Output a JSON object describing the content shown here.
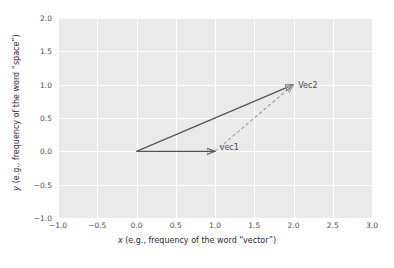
{
  "chart_data": {
    "type": "scatter",
    "title": "",
    "xlabel": "x (e.g., frequency of the word \"vector\")",
    "ylabel": "y (e.g., frequency of the word \"space\")",
    "xlim": [
      -1.0,
      3.0
    ],
    "ylim": [
      -1.0,
      2.0
    ],
    "grid": true,
    "legend": null,
    "xticks": [
      "-1.0",
      "-0.5",
      "0.0",
      "0.5",
      "1.0",
      "1.5",
      "2.0",
      "2.5",
      "3.0"
    ],
    "xtick_values": [
      -1.0,
      -0.5,
      0.0,
      0.5,
      1.0,
      1.5,
      2.0,
      2.5,
      3.0
    ],
    "yticks": [
      "-1.0",
      "-0.5",
      "0.0",
      "0.5",
      "1.0",
      "1.5",
      "2.0"
    ],
    "ytick_values": [
      -1.0,
      -0.5,
      0.0,
      0.5,
      1.0,
      1.5,
      2.0
    ],
    "vectors": [
      {
        "name": "vec1",
        "label": "vec1",
        "tail": [
          0.0,
          0.0
        ],
        "head": [
          1.0,
          0.0
        ],
        "style": "solid",
        "color": "#555555",
        "label_offset": [
          0.06,
          -0.13
        ]
      },
      {
        "name": "vec2",
        "label": "Vec2",
        "tail": [
          0.0,
          0.0
        ],
        "head": [
          2.0,
          1.0
        ],
        "style": "solid",
        "color": "#555555",
        "label_offset": [
          0.06,
          -0.06
        ]
      },
      {
        "name": "vec2-translated",
        "label": "",
        "tail": [
          1.0,
          0.0
        ],
        "head": [
          2.0,
          1.0
        ],
        "style": "dashed",
        "color": "#9a9a9a",
        "label_offset": [
          0,
          0
        ]
      }
    ],
    "colors": {
      "plot_background": "#eaeaea",
      "figure_background": "#ffffff",
      "gridline": "#ffffff",
      "vector_solid": "#555555",
      "vector_dashed": "#9a9a9a",
      "tick_text": "#4d4d4d",
      "axis_title_text": "#2b2b2b"
    }
  },
  "axis": {
    "x_label_prefix": "x",
    "x_label_rest": " (e.g., frequency of the word “vector”)",
    "y_label_prefix": "y",
    "y_label_rest": " (e.g., frequency of the word “space”)"
  }
}
